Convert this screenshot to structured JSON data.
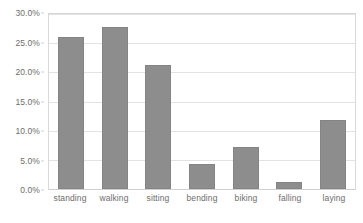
{
  "chart_data": {
    "type": "bar",
    "title": "",
    "xlabel": "",
    "ylabel": "",
    "categories": [
      "standing",
      "walking",
      "sitting",
      "bending",
      "biking",
      "falling",
      "laying"
    ],
    "values": [
      26.1,
      27.8,
      21.2,
      4.3,
      7.2,
      1.2,
      11.9
    ],
    "value_suffix": "%",
    "ylim": [
      0,
      30
    ],
    "ytick_values": [
      0,
      5,
      10,
      15,
      20,
      25,
      30
    ],
    "ytick_labels": [
      "0.0%",
      "5.0%",
      "10.0%",
      "15.0%",
      "20.0%",
      "25.0%",
      "30.0%"
    ],
    "grid": true,
    "legend": false,
    "legend_position": "none",
    "bar_color": "#8d8d8d",
    "gridline_color": "#e3e3e3",
    "axis_text_color": "#6d6d6d",
    "plot_background": "#ffffff"
  }
}
